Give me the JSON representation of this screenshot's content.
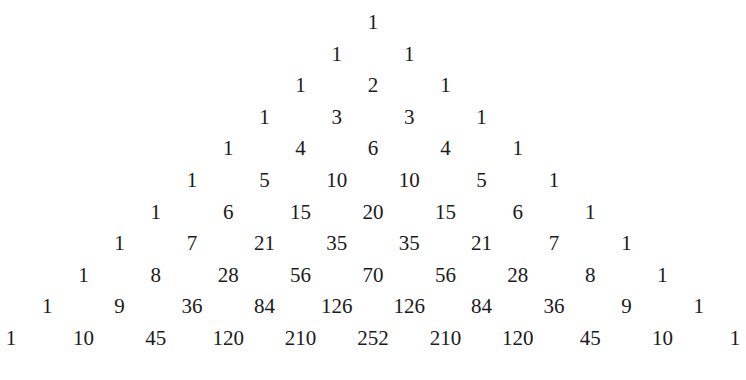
{
  "rows": [
    [
      1
    ],
    [
      1,
      1
    ],
    [
      1,
      2,
      1
    ],
    [
      1,
      3,
      3,
      1
    ],
    [
      1,
      4,
      6,
      4,
      1
    ],
    [
      1,
      5,
      10,
      10,
      5,
      1
    ],
    [
      1,
      6,
      15,
      20,
      15,
      6,
      1
    ],
    [
      1,
      7,
      21,
      35,
      35,
      21,
      7,
      1
    ],
    [
      1,
      8,
      28,
      56,
      70,
      56,
      28,
      8,
      1
    ],
    [
      1,
      9,
      36,
      84,
      126,
      126,
      84,
      36,
      9,
      1
    ],
    [
      1,
      10,
      45,
      120,
      210,
      252,
      210,
      120,
      45,
      10,
      1
    ]
  ]
}
